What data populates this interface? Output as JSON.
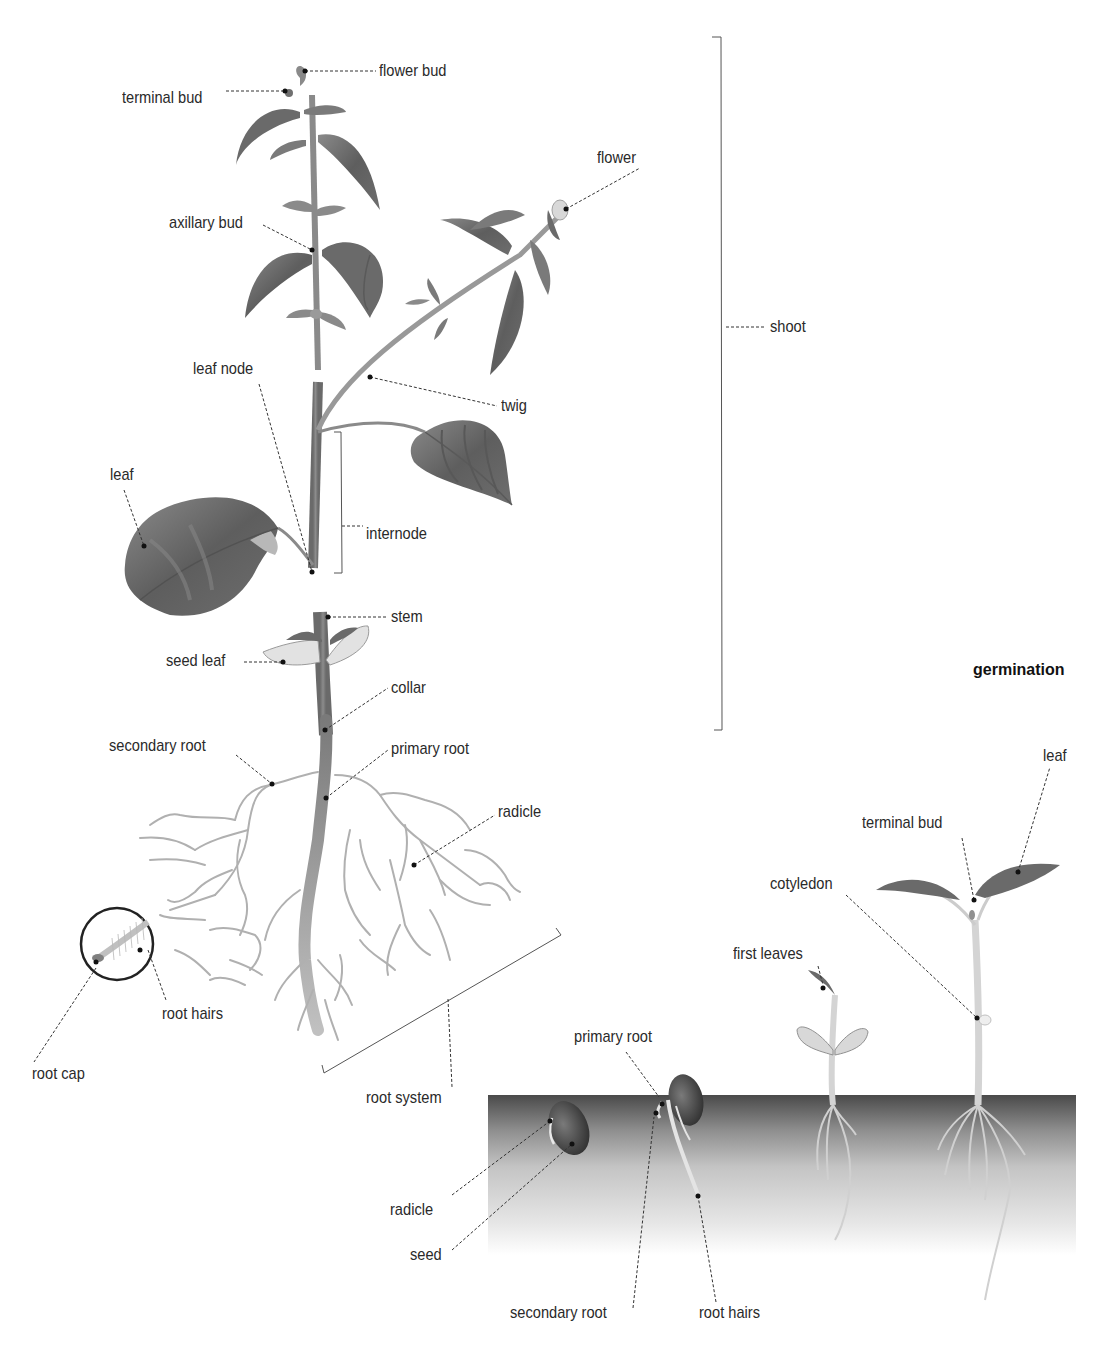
{
  "diagram": {
    "type": "labeled-illustration",
    "colors": {
      "leaf_dark": "#5c5c5c",
      "leaf_mid": "#7d7d7d",
      "leaf_light": "#a8a8a8",
      "stem": "#8a8a8a",
      "root": "#b4b4b4",
      "soil_top": "#4a4a4a",
      "soil_bottom": "#ffffff",
      "leader_line": "#333333",
      "text": "#2a2a2a"
    },
    "main_plant": {
      "labels": {
        "flower_bud": "flower bud",
        "terminal_bud": "terminal bud",
        "flower": "flower",
        "axillary_bud": "axillary bud",
        "shoot": "shoot",
        "leaf_node": "leaf node",
        "twig": "twig",
        "leaf": "leaf",
        "internode": "internode",
        "stem": "stem",
        "seed_leaf": "seed leaf",
        "collar": "collar",
        "secondary_root": "secondary root",
        "primary_root": "primary root",
        "radicle": "radicle",
        "root_hairs": "root hairs",
        "root_cap": "root cap",
        "root_system": "root system"
      }
    },
    "germination": {
      "title": "germination",
      "labels": {
        "leaf": "leaf",
        "terminal_bud": "terminal bud",
        "cotyledon": "cotyledon",
        "first_leaves": "first leaves",
        "primary_root": "primary root",
        "radicle": "radicle",
        "seed": "seed",
        "secondary_root": "secondary root",
        "root_hairs": "root hairs"
      }
    }
  }
}
